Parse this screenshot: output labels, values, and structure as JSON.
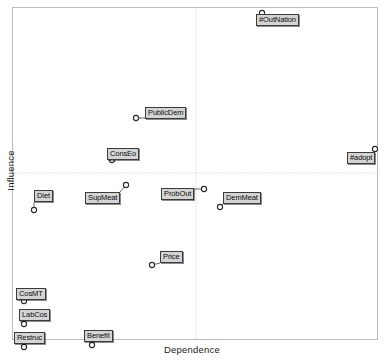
{
  "chart_data": {
    "type": "scatter",
    "title": "",
    "xlabel": "Dependence",
    "ylabel": "Influence",
    "xlim": [
      0,
      100
    ],
    "ylim": [
      0,
      100
    ],
    "grid": "center-crosshair-dotted",
    "legend": "none",
    "marker": "open-circle",
    "points": [
      {
        "label": "#OutNation",
        "x": 62.5,
        "y": 98.5,
        "px": 262,
        "py": 13,
        "lx": 256,
        "ly": 14
      },
      {
        "label": "#adopt",
        "x": 99.5,
        "y": 53.5,
        "px": 375,
        "py": 149,
        "lx": 347,
        "ly": 152
      },
      {
        "label": "PublicDem",
        "x": 34.0,
        "y": 66.0,
        "px": 136,
        "py": 118,
        "lx": 145,
        "ly": 107
      },
      {
        "label": "ConsEo",
        "x": 27.5,
        "y": 54.5,
        "px": 112,
        "py": 160,
        "lx": 107,
        "ly": 148
      },
      {
        "label": "Diet",
        "x": 7.5,
        "y": 44.0,
        "px": 34,
        "py": 210,
        "lx": 34,
        "ly": 190
      },
      {
        "label": "SupMeat",
        "x": 30.5,
        "y": 50.0,
        "px": 126,
        "py": 185,
        "lx": 85,
        "ly": 192
      },
      {
        "label": "ProbOut",
        "x": 47.5,
        "y": 49.0,
        "px": 204,
        "py": 189,
        "lx": 161,
        "ly": 188
      },
      {
        "label": "DemMeat",
        "x": 56.0,
        "y": 45.0,
        "px": 220,
        "py": 207,
        "lx": 223,
        "ly": 192
      },
      {
        "label": "Price",
        "x": 40.5,
        "y": 32.0,
        "px": 152,
        "py": 265,
        "lx": 160,
        "ly": 251
      },
      {
        "label": "CosMT",
        "x": 2.0,
        "y": 16.5,
        "px": 24,
        "py": 301,
        "lx": 16,
        "ly": 288
      },
      {
        "label": "LabCos",
        "x": 2.0,
        "y": 10.0,
        "px": 24,
        "py": 324,
        "lx": 19,
        "ly": 309
      },
      {
        "label": "Restruc",
        "x": 3.0,
        "y": 2.0,
        "px": 24,
        "py": 347,
        "lx": 14,
        "ly": 332
      },
      {
        "label": "Benefit",
        "x": 22.0,
        "y": 1.5,
        "px": 92,
        "py": 345,
        "lx": 84,
        "ly": 330
      }
    ]
  },
  "colors": {
    "frame": "#b9b9b9",
    "gridline": "#c4c4c4",
    "marker_stroke": "#2a2a2a",
    "marker_fill": "#ffffff",
    "leader": "#555555",
    "label_bg": "#d4d4d4",
    "label_border": "#3b3b3b",
    "text": "#0d0d0d"
  }
}
